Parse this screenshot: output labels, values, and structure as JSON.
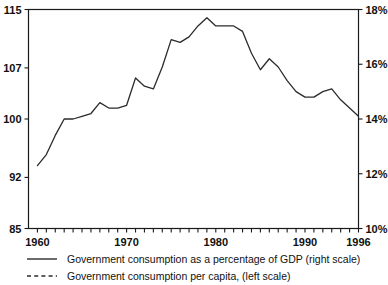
{
  "chart_data": {
    "type": "line",
    "title": "",
    "subtitle": "",
    "xlabel": "",
    "ylabel": "",
    "grid": false,
    "legend_position": "bottom-left",
    "x": [
      1960,
      1961,
      1962,
      1963,
      1964,
      1965,
      1966,
      1967,
      1968,
      1969,
      1970,
      1971,
      1972,
      1973,
      1974,
      1975,
      1976,
      1977,
      1978,
      1979,
      1980,
      1981,
      1982,
      1983,
      1984,
      1985,
      1986,
      1987,
      1988,
      1989,
      1990,
      1991,
      1992,
      1993,
      1994,
      1995,
      1996
    ],
    "xlim": [
      1959,
      1996
    ],
    "x_ticks_labeled": [
      "1960",
      "1970",
      "1980",
      "1990",
      "1996"
    ],
    "x_ticks_labeled_values": [
      1960,
      1970,
      1980,
      1990,
      1996
    ],
    "axes": {
      "left": {
        "label": "",
        "lim": [
          85,
          115
        ],
        "ticks": [
          85,
          92,
          100,
          107,
          115
        ],
        "tick_labels": [
          "85",
          "92",
          "100",
          "107",
          "115"
        ],
        "applies_to": "Government consumption per capita, (left scale)"
      },
      "right": {
        "label": "",
        "lim": [
          10,
          18
        ],
        "ticks": [
          10,
          12,
          14,
          16,
          18
        ],
        "tick_labels": [
          "10%",
          "12%",
          "14%",
          "16%",
          "18%"
        ],
        "applies_to": "Government consumption as a percentage of GDP (right scale)"
      }
    },
    "series": [
      {
        "name": "Government consumption as a percentage of GDP (right scale)",
        "axis": "right",
        "style": "solid",
        "color": "#2b2b2b",
        "x": [
          1960,
          1961,
          1962,
          1963,
          1964,
          1965,
          1966,
          1967,
          1968,
          1969,
          1970,
          1971,
          1972,
          1973,
          1974,
          1975,
          1976,
          1977,
          1978,
          1979,
          1980,
          1981,
          1982,
          1983,
          1984,
          1985,
          1986,
          1987,
          1988,
          1989,
          1990,
          1991,
          1992,
          1993,
          1994,
          1995,
          1996
        ],
        "values": [
          12.3,
          12.7,
          13.4,
          14.0,
          14.0,
          14.1,
          14.2,
          14.6,
          14.4,
          14.4,
          14.5,
          15.5,
          15.2,
          15.1,
          15.9,
          16.9,
          16.8,
          17.0,
          17.4,
          17.7,
          17.4,
          17.4,
          17.4,
          17.2,
          16.4,
          15.8,
          16.2,
          15.9,
          15.4,
          15.0,
          14.8,
          14.8,
          15.0,
          15.1,
          14.7,
          14.4,
          14.1
        ]
      },
      {
        "name": "Government consumption per capita, (left scale)",
        "axis": "left",
        "style": "dashed",
        "color": "#2b2b2b",
        "x": [
          1970,
          1971,
          1972,
          1973,
          1974,
          1975,
          1976,
          1977,
          1978,
          1979,
          1980,
          1981,
          1982,
          1983,
          1984,
          1985,
          1986,
          1987,
          1988,
          1989,
          1990,
          1991,
          1992,
          1993,
          1994,
          1995,
          1996
        ],
        "values": [
          14.0,
          14.7,
          14.1,
          14.0,
          14.9,
          15.3,
          15.6,
          16.1,
          16.6,
          17.1,
          16.4,
          15.2,
          14.3,
          13.4,
          12.9,
          12.2,
          11.8,
          11.9,
          11.5,
          11.4,
          11.3,
          10.8,
          10.3,
          10.2,
          10.6,
          10.7,
          11.9
        ]
      }
    ],
    "legend": [
      {
        "label": "Government consumption as a percentage of GDP (right scale)",
        "style": "solid"
      },
      {
        "label": "Government consumption per capita, (left scale)",
        "style": "dashed"
      }
    ]
  }
}
